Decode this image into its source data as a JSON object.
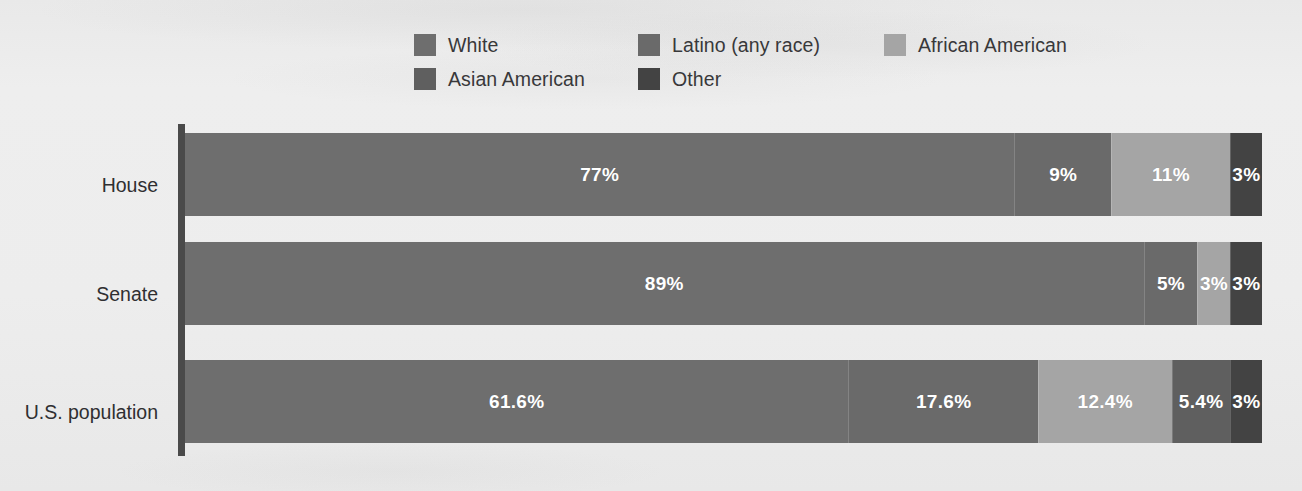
{
  "chart_data": {
    "type": "bar",
    "subtype": "horizontal-stacked-100",
    "title": "",
    "subtitle": "",
    "xlabel": "",
    "ylabel": "",
    "xlim": [
      0,
      100
    ],
    "grid": false,
    "legend_position": "top",
    "categories": [
      "House",
      "Senate",
      "U.S. population"
    ],
    "series": [
      {
        "name": "White",
        "color": "#6e6e6e",
        "values": [
          77,
          89,
          61.6
        ],
        "labels": [
          "77%",
          "89%",
          "61.6%"
        ]
      },
      {
        "name": "Latino (any race)",
        "color": "#6a6a6a",
        "values": [
          9,
          5,
          17.6
        ],
        "labels": [
          "9%",
          "5%",
          "17.6%"
        ]
      },
      {
        "name": "African American",
        "color": "#a5a5a5",
        "values": [
          11,
          3,
          12.4
        ],
        "labels": [
          "11%",
          "3%",
          "12.4%"
        ]
      },
      {
        "name": "Asian American",
        "color": "#5f5f5f",
        "values": [
          0,
          0,
          5.4
        ],
        "labels": [
          "",
          "",
          "5.4%"
        ]
      },
      {
        "name": "Other",
        "color": "#434343",
        "values": [
          3,
          3,
          3
        ],
        "labels": [
          "3%",
          "3%",
          "3%"
        ]
      }
    ],
    "rows": [
      {
        "category": "House",
        "segments": [
          {
            "series": "White",
            "value": 77,
            "label": "77%",
            "color": "#6e6e6e",
            "show_label": true
          },
          {
            "series": "Latino (any race)",
            "value": 9,
            "label": "9%",
            "color": "#6a6a6a",
            "show_label": true
          },
          {
            "series": "African American",
            "value": 11,
            "label": "11%",
            "color": "#a5a5a5",
            "show_label": true
          },
          {
            "series": "Other",
            "value": 3,
            "label": "3%",
            "color": "#434343",
            "show_label": true
          }
        ]
      },
      {
        "category": "Senate",
        "segments": [
          {
            "series": "White",
            "value": 89,
            "label": "89%",
            "color": "#6e6e6e",
            "show_label": true
          },
          {
            "series": "Latino (any race)",
            "value": 5,
            "label": "5%",
            "color": "#6a6a6a",
            "show_label": true
          },
          {
            "series": "African American",
            "value": 3,
            "label": "3%",
            "color": "#a5a5a5",
            "show_label": true
          },
          {
            "series": "Other",
            "value": 3,
            "label": "3%",
            "color": "#434343",
            "show_label": true
          }
        ]
      },
      {
        "category": "U.S. population",
        "segments": [
          {
            "series": "White",
            "value": 61.6,
            "label": "61.6%",
            "color": "#6e6e6e",
            "show_label": true
          },
          {
            "series": "Latino (any race)",
            "value": 17.6,
            "label": "17.6%",
            "color": "#6a6a6a",
            "show_label": true
          },
          {
            "series": "African American",
            "value": 12.4,
            "label": "12.4%",
            "color": "#a5a5a5",
            "show_label": true
          },
          {
            "series": "Asian American",
            "value": 5.4,
            "label": "5.4%",
            "color": "#5f5f5f",
            "show_label": true
          },
          {
            "series": "Other",
            "value": 3,
            "label": "3%",
            "color": "#434343",
            "show_label": true
          }
        ]
      }
    ]
  },
  "legend": {
    "items": [
      {
        "label": "White",
        "color": "#6e6e6e"
      },
      {
        "label": "Latino (any race)",
        "color": "#6a6a6a"
      },
      {
        "label": "African American",
        "color": "#a5a5a5"
      },
      {
        "label": "Asian American",
        "color": "#5f5f5f"
      },
      {
        "label": "Other",
        "color": "#434343"
      }
    ]
  },
  "axis": {
    "line_color": "#4a4a4a",
    "labels": [
      "House",
      "Senate",
      "U.S. population"
    ]
  },
  "colors": {
    "background": "#ececec",
    "text": "#2f2f31",
    "bar_label_text": "#ffffff"
  }
}
